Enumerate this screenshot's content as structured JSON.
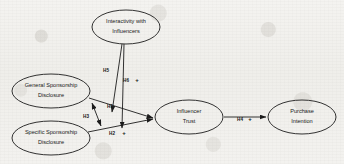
{
  "diagram": {
    "type": "path-model",
    "nodes": [
      {
        "id": "interactivity",
        "line1": "Interactivity with",
        "line2": "Influencers",
        "cx": 126,
        "cy": 27,
        "rx": 34,
        "ry": 17
      },
      {
        "id": "general-disclosure",
        "line1": "General Sponsorship",
        "line2": "Disclosure",
        "cx": 51,
        "cy": 91,
        "rx": 39,
        "ry": 17
      },
      {
        "id": "specific-disclosure",
        "line1": "Specific Sponsorship",
        "line2": "Disclosure",
        "cx": 51,
        "cy": 138,
        "rx": 39,
        "ry": 17
      },
      {
        "id": "influencer-trust",
        "line1": "Influencer",
        "line2": "Trust",
        "cx": 189,
        "cy": 117,
        "rx": 34,
        "ry": 17
      },
      {
        "id": "purchase-intention",
        "line1": "Purchase",
        "line2": "Intention",
        "cx": 302,
        "cy": 117,
        "rx": 34,
        "ry": 17
      }
    ],
    "edges": [
      {
        "id": "h1",
        "label": "H1",
        "sign": "",
        "from": "general-disclosure",
        "to": "influencer-trust",
        "label_x": 110,
        "label_y": 107
      },
      {
        "id": "h2",
        "label": "H2",
        "sign": "+",
        "from": "specific-disclosure",
        "to": "influencer-trust",
        "label_x": 112,
        "label_y": 134,
        "sign_x": 124,
        "sign_y": 133
      },
      {
        "id": "h3",
        "label": "H3",
        "sign": "",
        "from": "general-disclosure",
        "to": "specific-disclosure",
        "label_x": 86,
        "label_y": 117
      },
      {
        "id": "h4",
        "label": "H4",
        "sign": "+",
        "from": "influencer-trust",
        "to": "purchase-intention",
        "label_x": 240,
        "label_y": 120,
        "sign_x": 250,
        "sign_y": 119
      },
      {
        "id": "h5",
        "label": "H5",
        "sign": "",
        "from": "interactivity",
        "to": "h1-path",
        "label_x": 106,
        "label_y": 71
      },
      {
        "id": "h6",
        "label": "H6",
        "sign": "+",
        "from": "interactivity",
        "to": "h2-path",
        "label_x": 126,
        "label_y": 81,
        "sign_x": 137,
        "sign_y": 80
      }
    ],
    "colors": {
      "stroke": "#1b1b1b",
      "text": "#171717",
      "background": "#f2f1ee"
    }
  }
}
